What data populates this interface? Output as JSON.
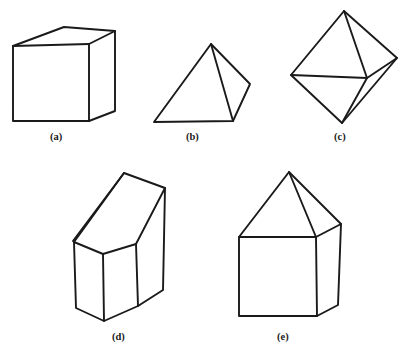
{
  "figure": {
    "background_color": "#ffffff",
    "line_color": "#1a1a1a",
    "fill_color": "#ffffff",
    "width": 404,
    "height": 357,
    "caption_a": "(a)",
    "caption_b": "(b)",
    "caption_c": "(c)",
    "caption_d": "(d)",
    "caption_e": "(e)",
    "shapes": [
      {
        "key": "a",
        "name": "cube",
        "label": "(a)",
        "label_x": 50,
        "label_y": 131,
        "outline": "13,46 64,27 115,31 115,111 89,121 13,121",
        "edges": [
          "M 13,46 L 89,44 L 115,31",
          "M 89,44 L 89,121"
        ]
      },
      {
        "key": "b",
        "name": "square-pyramid",
        "label": "(b)",
        "label_x": 186,
        "label_y": 131,
        "outline": "211,44 250,84 233,121 154,122",
        "edges": [
          "M 211,44 L 233,121"
        ]
      },
      {
        "key": "c",
        "name": "octahedron",
        "label": "(c)",
        "label_x": 334,
        "label_y": 131,
        "outline": "344,11 397,58 342,123 291,75",
        "edges": [
          "M 291,75 L 367,78",
          "M 367,78 L 344,11",
          "M 367,78 L 397,58",
          "M 367,78 L 342,123"
        ]
      },
      {
        "key": "d",
        "name": "oblique-prism",
        "label": "(d)",
        "label_x": 112,
        "label_y": 331,
        "outline": "124,173 165,188 163,290 138,306 104,321 76,308 74,242",
        "edges": [
          "M 124,173 L 73,241",
          "M 74,242 L 103,254 L 136,244",
          "M 136,244 L 165,188",
          "M 103,254 L 104,321",
          "M 136,244 L 138,306"
        ]
      },
      {
        "key": "e",
        "name": "house-prism",
        "label": "(e)",
        "label_x": 277,
        "label_y": 331,
        "outline": "289,172 341,224 338,305 317,316 239,316 239,237",
        "edges": [
          "M 239,237 L 316,237 L 341,224",
          "M 316,237 L 289,172",
          "M 316,237 L 317,316"
        ]
      }
    ]
  }
}
